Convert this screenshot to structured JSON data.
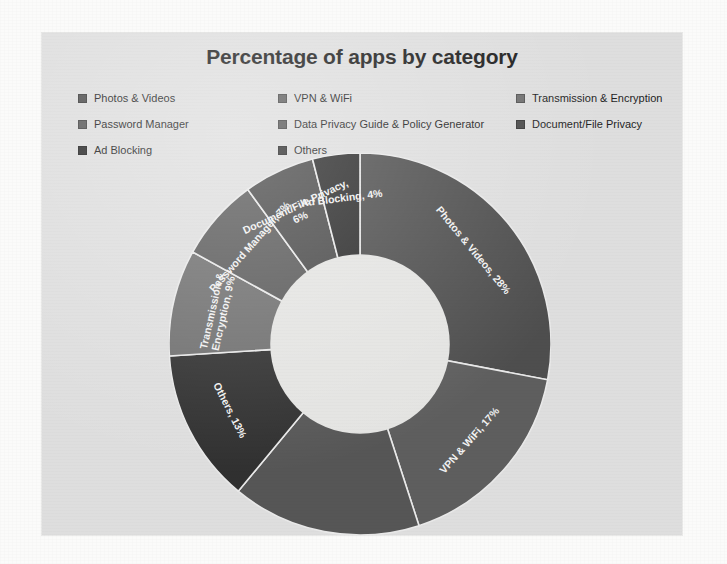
{
  "chart_data": {
    "type": "pie",
    "variant": "donut",
    "title": "Percentage of apps by category",
    "xlabel": "",
    "ylabel": "",
    "legend_position": "top",
    "grid": false,
    "value_unit": "%",
    "categories": [
      "Photos & Videos",
      "VPN & WiFi",
      "Transmission & Encryption",
      "Password Manager",
      "Data Privacy Guide & Policy Generator",
      "Document/File Privacy",
      "Ad Blocking",
      "Others"
    ],
    "values": [
      28,
      17,
      9,
      7,
      16,
      6,
      4,
      13
    ],
    "slices": [
      {
        "label": "Photos & Videos",
        "value": 28,
        "data_label": "Photos & Videos, 28%",
        "color": "#4e4e4e",
        "label_shown": true
      },
      {
        "label": "VPN & WiFi",
        "value": 17,
        "data_label": "VPN & WiFi, 17%",
        "color": "#5e5e5e",
        "label_shown": true
      },
      {
        "label": "Data Privacy Guide & Policy Generator",
        "value": 16,
        "data_label": "",
        "color": "#565656",
        "label_shown": false
      },
      {
        "label": "Others",
        "value": 13,
        "data_label": "Others, 13%",
        "color": "#303030",
        "label_shown": true
      },
      {
        "label": "Transmission & Encryption",
        "value": 9,
        "data_label": "Transmission & Encryption, 9%",
        "color": "#6f6f6f",
        "label_shown": true
      },
      {
        "label": "Password Manager",
        "value": 7,
        "data_label": "Password Manager, 7%",
        "color": "#5a5a5a",
        "label_shown": true
      },
      {
        "label": "Document/File Privacy",
        "value": 6,
        "data_label": "Document/File Privacy, 6%",
        "color": "#4a4a4a",
        "label_shown": true
      },
      {
        "label": "Ad Blocking",
        "value": 4,
        "data_label": "Ad Blocking, 4%",
        "color": "#2b2b2b",
        "label_shown": true
      }
    ],
    "hole_ratio": 0.47,
    "start_angle_deg": 0
  },
  "title": "Percentage of apps by category",
  "legend": {
    "columns": 3,
    "items": [
      {
        "label": "Photos & Videos",
        "color": "#4e4e4e",
        "col": 1,
        "row": 1
      },
      {
        "label": "VPN & WiFi",
        "color": "#5e5e5e",
        "col": 2,
        "row": 1
      },
      {
        "label": "Transmission & Encryption",
        "color": "#6f6f6f",
        "col": 3,
        "row": 1
      },
      {
        "label": "Password Manager",
        "color": "#5a5a5a",
        "col": 1,
        "row": 2
      },
      {
        "label": "Data Privacy Guide & Policy Generator",
        "color": "#565656",
        "col": 2,
        "row": 2
      },
      {
        "label": "Document/File Privacy",
        "color": "#4a4a4a",
        "col": 3,
        "row": 2
      },
      {
        "label": "Ad Blocking",
        "color": "#2b2b2b",
        "col": 1,
        "row": 3
      },
      {
        "label": "Others",
        "color": "#303030",
        "col": 2,
        "row": 3
      }
    ]
  },
  "colors": {
    "page_background": "#fbfbfa",
    "panel_background": "#dedede",
    "donut_hole": "#e4e4e2",
    "title_text": "#1d1d1d",
    "legend_text": "#1f1f1f",
    "slice_label_text": "#f2f2f2",
    "slice_divider": "#e9e9e9"
  }
}
